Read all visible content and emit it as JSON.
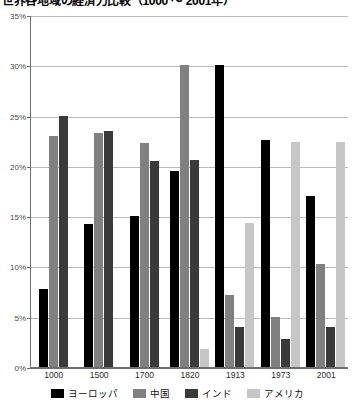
{
  "chart_data": {
    "type": "bar",
    "title": "世界各地域の経済力比較（1000 ～ 2001年）",
    "xlabel": "",
    "ylabel": "",
    "ylim": [
      0,
      35
    ],
    "ytick_labels": [
      "0%",
      "5%",
      "10%",
      "15%",
      "20%",
      "25%",
      "30%",
      "35%"
    ],
    "ytick_values": [
      0,
      5,
      10,
      15,
      20,
      25,
      30,
      35
    ],
    "grid": true,
    "legend_position": "bottom",
    "categories": [
      "1000",
      "1500",
      "1700",
      "1820",
      "1913",
      "1973",
      "2001"
    ],
    "series": [
      {
        "name": "ヨーロッパ",
        "color": "#000000",
        "values": [
          7.8,
          14.2,
          15.0,
          19.5,
          30.0,
          22.6,
          17.0
        ]
      },
      {
        "name": "中国",
        "color": "#808080",
        "values": [
          23.0,
          23.3,
          22.3,
          30.0,
          7.2,
          5.0,
          10.2
        ]
      },
      {
        "name": "インド",
        "color": "#3a3a3a",
        "values": [
          25.0,
          23.5,
          20.5,
          20.6,
          4.0,
          2.8,
          4.0
        ]
      },
      {
        "name": "アメリカ",
        "color": "#c6c6c6",
        "values": [
          null,
          null,
          null,
          1.8,
          14.3,
          22.4,
          22.4
        ]
      }
    ]
  }
}
